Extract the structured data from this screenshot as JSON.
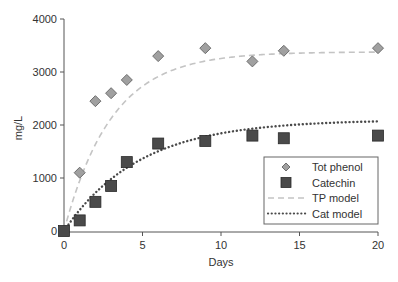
{
  "chart_data": {
    "type": "scatter",
    "title": "",
    "xlabel": "Days",
    "ylabel": "mg/L",
    "xlim": [
      0,
      20
    ],
    "ylim": [
      0,
      4000
    ],
    "xticks": [
      0,
      5,
      10,
      15,
      20
    ],
    "yticks": [
      0,
      1000,
      2000,
      3000,
      4000
    ],
    "grid": false,
    "legend_position": "lower right",
    "series": [
      {
        "name": "Tot phenol",
        "kind": "markers",
        "marker": "diamond",
        "color": "#a0a0a0",
        "edge_color": "#6e6e6e",
        "x": [
          1,
          2,
          3,
          4,
          6,
          9,
          12,
          14,
          20
        ],
        "y": [
          1100,
          2450,
          2600,
          2850,
          3300,
          3450,
          3200,
          3400,
          3450
        ]
      },
      {
        "name": "Catechin",
        "kind": "markers",
        "marker": "square",
        "color": "#4a4a4a",
        "edge_color": "#2a2a2a",
        "x": [
          0,
          1,
          2,
          3,
          4,
          6,
          9,
          12,
          14,
          20
        ],
        "y": [
          0,
          200,
          550,
          850,
          1300,
          1650,
          1700,
          1800,
          1750,
          1800
        ]
      },
      {
        "name": "TP model",
        "kind": "line",
        "style": "dashed",
        "color": "#c4c4c4",
        "model": {
          "form": "A*(1-exp(-k*t))",
          "A": 3380,
          "k": 0.33
        }
      },
      {
        "name": "Cat model",
        "kind": "line",
        "style": "dotted",
        "color": "#4a4a4a",
        "model": {
          "form": "A*(1-exp(-k*t))",
          "A": 2100,
          "k": 0.21
        }
      }
    ]
  },
  "legend": {
    "items": [
      "Tot phenol",
      "Catechin",
      "TP model",
      "Cat model"
    ]
  },
  "layout": {
    "plot": {
      "x0": 64,
      "x1": 378,
      "y0": 231,
      "y1": 19
    }
  }
}
